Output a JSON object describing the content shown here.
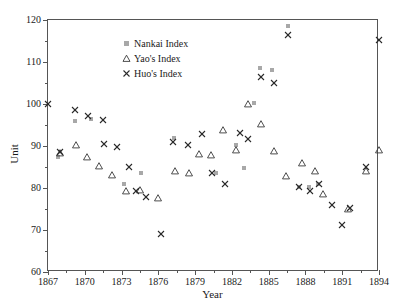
{
  "chart_data": {
    "type": "scatter",
    "title": "",
    "xlabel": "Year",
    "ylabel": "Unit",
    "xlim": [
      1867,
      1894
    ],
    "ylim": [
      60,
      120
    ],
    "xticks": [
      1867,
      1870,
      1873,
      1876,
      1879,
      1882,
      1885,
      1888,
      1891,
      1894
    ],
    "yticks": [
      60,
      70,
      80,
      90,
      100,
      110,
      120
    ],
    "x_minor_step": 1.5,
    "y_minor_step": 5,
    "grid": false,
    "legend_position": "top-center",
    "series": [
      {
        "name": "Nankai Index",
        "marker": "square",
        "color": "#a8a8a8",
        "points": [
          [
            1867.8,
            87.5
          ],
          [
            1869.2,
            96.0
          ],
          [
            1870.5,
            96.5
          ],
          [
            1873.2,
            81.0
          ],
          [
            1874.6,
            83.5
          ],
          [
            1877.3,
            91.9
          ],
          [
            1880.7,
            83.6
          ],
          [
            1882.3,
            90.3
          ],
          [
            1883.0,
            84.8
          ],
          [
            1883.8,
            100.3
          ],
          [
            1884.3,
            108.5
          ],
          [
            1885.3,
            108.2
          ],
          [
            1886.6,
            118.5
          ],
          [
            1887.5,
            80.3
          ],
          [
            1888.3,
            80.2
          ],
          [
            1889.0,
            81.0
          ]
        ]
      },
      {
        "name": "Yao's Index",
        "marker": "triangle",
        "color": "#3a3a3a",
        "points": [
          [
            1868.0,
            88.4
          ],
          [
            1869.3,
            90.2
          ],
          [
            1870.2,
            87.5
          ],
          [
            1871.2,
            85.3
          ],
          [
            1872.2,
            83.2
          ],
          [
            1873.4,
            79.3
          ],
          [
            1874.5,
            79.6
          ],
          [
            1876.0,
            77.7
          ],
          [
            1877.4,
            84.0
          ],
          [
            1878.5,
            83.5
          ],
          [
            1879.3,
            88.0
          ],
          [
            1880.3,
            87.9
          ],
          [
            1881.3,
            93.8
          ],
          [
            1882.3,
            89.0
          ],
          [
            1883.3,
            100.0
          ],
          [
            1884.4,
            95.3
          ],
          [
            1885.4,
            88.8
          ],
          [
            1886.4,
            82.8
          ],
          [
            1887.7,
            86.0
          ],
          [
            1888.8,
            84.0
          ],
          [
            1889.4,
            78.5
          ],
          [
            1891.5,
            75.0
          ],
          [
            1892.9,
            84.0
          ],
          [
            1894.0,
            89.0
          ]
        ]
      },
      {
        "name": "Huo's Index",
        "marker": "cross",
        "color": "#2a2a2a",
        "points": [
          [
            1867.0,
            100.0
          ],
          [
            1868.0,
            88.6
          ],
          [
            1869.2,
            98.5
          ],
          [
            1870.3,
            97.2
          ],
          [
            1871.5,
            96.3
          ],
          [
            1871.6,
            90.5
          ],
          [
            1872.6,
            89.8
          ],
          [
            1873.6,
            85.0
          ],
          [
            1874.2,
            79.3
          ],
          [
            1875.0,
            77.8
          ],
          [
            1876.2,
            69.0
          ],
          [
            1877.2,
            91.0
          ],
          [
            1878.4,
            90.2
          ],
          [
            1879.6,
            92.8
          ],
          [
            1880.4,
            83.5
          ],
          [
            1881.4,
            81.0
          ],
          [
            1882.7,
            93.0
          ],
          [
            1883.3,
            91.6
          ],
          [
            1884.4,
            106.5
          ],
          [
            1885.4,
            105.0
          ],
          [
            1886.6,
            116.5
          ],
          [
            1887.5,
            80.2
          ],
          [
            1888.4,
            79.2
          ],
          [
            1889.1,
            81.0
          ],
          [
            1890.2,
            76.0
          ],
          [
            1891.0,
            71.2
          ],
          [
            1891.6,
            75.2
          ],
          [
            1892.9,
            85.0
          ],
          [
            1894.0,
            115.2
          ]
        ]
      }
    ]
  },
  "legend": {
    "items": [
      {
        "label": "Nankai Index",
        "marker": "square"
      },
      {
        "label": "Yao's Index",
        "marker": "triangle"
      },
      {
        "label": "Huo's Index",
        "marker": "cross"
      }
    ]
  }
}
